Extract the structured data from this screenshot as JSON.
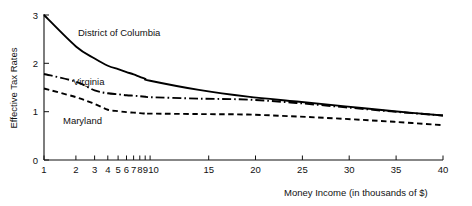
{
  "chart_data": {
    "type": "line",
    "title": "",
    "xlabel": "Money Income (in thousands of $)",
    "ylabel": "Effective Tax Rates",
    "xscale": "log-then-linear",
    "xlim": [
      1,
      40
    ],
    "ylim": [
      0,
      3
    ],
    "grid": false,
    "legend": "inline-annotations",
    "x_tick_labels": [
      "1",
      "2",
      "3",
      "4",
      "5",
      "6",
      "7",
      "8",
      "9",
      "10",
      "15",
      "20",
      "25",
      "30",
      "35",
      "40"
    ],
    "x_tick_values": [
      1,
      2,
      3,
      4,
      5,
      6,
      7,
      8,
      9,
      10,
      15,
      20,
      25,
      30,
      35,
      40
    ],
    "y_tick_labels": [
      "0",
      "1",
      "2",
      "3"
    ],
    "y_tick_values": [
      0,
      1,
      2,
      3
    ],
    "series": [
      {
        "name": "District of Columbia",
        "style": "solid",
        "color": "#000000",
        "x": [
          1,
          2,
          3,
          4,
          5,
          6,
          7,
          8,
          9,
          10,
          15,
          20,
          25,
          30,
          35,
          40
        ],
        "values": [
          3.0,
          2.35,
          2.1,
          1.95,
          1.88,
          1.82,
          1.77,
          1.72,
          1.68,
          1.64,
          1.45,
          1.31,
          1.21,
          1.11,
          1.01,
          0.92
        ]
      },
      {
        "name": "Virginia",
        "style": "dash-dot",
        "color": "#000000",
        "x": [
          1,
          2,
          3,
          4,
          5,
          6,
          7,
          8,
          9,
          10,
          15,
          20,
          25,
          30,
          35,
          40
        ],
        "values": [
          1.78,
          1.62,
          1.44,
          1.38,
          1.36,
          1.34,
          1.33,
          1.32,
          1.31,
          1.3,
          1.27,
          1.25,
          1.18,
          1.09,
          1.0,
          0.92
        ]
      },
      {
        "name": "Maryland",
        "style": "dashed",
        "color": "#000000",
        "x": [
          1,
          2,
          3,
          4,
          5,
          6,
          7,
          8,
          9,
          10,
          15,
          20,
          25,
          30,
          35,
          40
        ],
        "values": [
          1.48,
          1.3,
          1.16,
          1.04,
          1.01,
          0.99,
          0.98,
          0.97,
          0.96,
          0.96,
          0.95,
          0.94,
          0.9,
          0.85,
          0.79,
          0.72
        ]
      }
    ],
    "annotations": [
      {
        "text": "District of Columbia",
        "x_px": 78,
        "y_px": 36
      },
      {
        "text": "Virginia",
        "x_px": 73,
        "y_px": 85
      },
      {
        "text": "Maryland",
        "x_px": 63,
        "y_px": 124
      }
    ]
  }
}
